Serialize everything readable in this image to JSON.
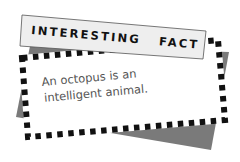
{
  "banner": {
    "title_word1": "INTERESTING",
    "title_word2": "FACT"
  },
  "card": {
    "line1": "An octopus is an",
    "line2": "intelligent animal."
  },
  "colors": {
    "shadow": "#7a7a7a",
    "banner_fill": "#eeeeee",
    "card_fill": "#ffffff",
    "checker_dark": "#111111",
    "text_body": "#555555",
    "text_banner": "#111111"
  }
}
